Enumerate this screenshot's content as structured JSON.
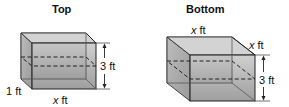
{
  "figures": [
    {
      "title": "Top",
      "labels": {
        "depth": "1 ft",
        "width_var": "x",
        "width_unit": " ft",
        "height": "3 ft"
      }
    },
    {
      "title": "Bottom",
      "labels": {
        "top_width_var": "x",
        "top_width_unit": " ft",
        "depth_var": "x",
        "depth_unit": " ft",
        "height": "3 ft"
      }
    }
  ],
  "colors": {
    "face_front": "#a9a9a9",
    "face_top": "#c4c4c4",
    "face_side": "#b5b5b5",
    "edge": "#2a2a2a"
  }
}
